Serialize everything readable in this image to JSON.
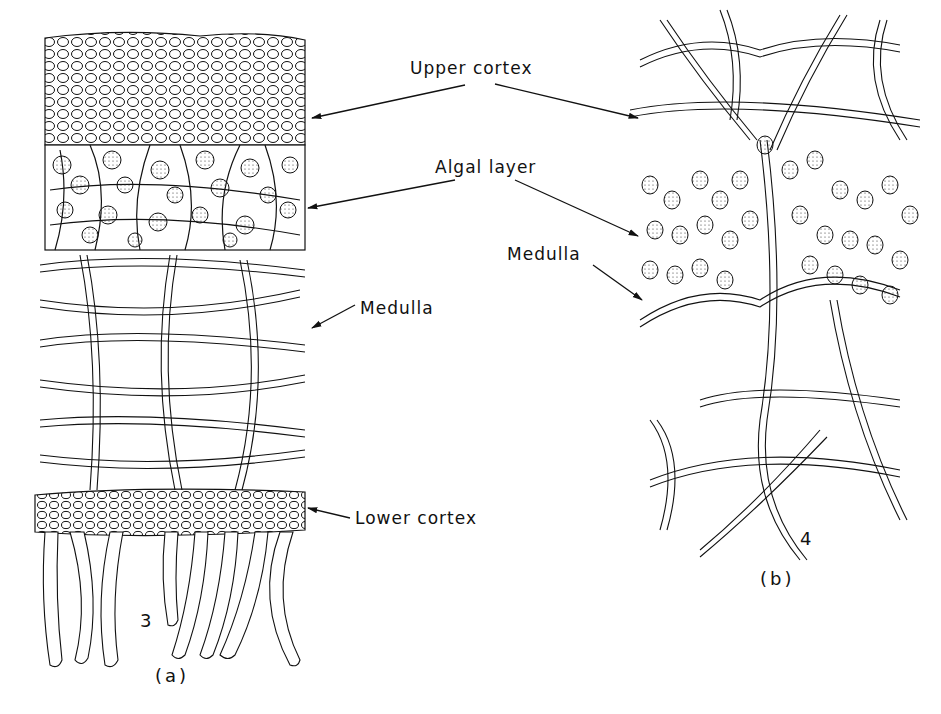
{
  "diagram": {
    "labels": {
      "upper_cortex": "Upper cortex",
      "algal_layer": "Algal layer",
      "medulla_a": "Medulla",
      "medulla_b": "Medulla",
      "lower_cortex": "Lower cortex"
    },
    "figures": [
      {
        "number": "3",
        "caption": "(a)",
        "type": "heteromerous thallus with upper cortex, algal layer, medulla, lower cortex and rhizines"
      },
      {
        "number": "4",
        "caption": "(b)",
        "type": "thallus with loose hyphal upper layer, algal layer and medulla, no lower cortex"
      }
    ],
    "colors": {
      "ink": "#111111",
      "background": "#ffffff"
    }
  }
}
